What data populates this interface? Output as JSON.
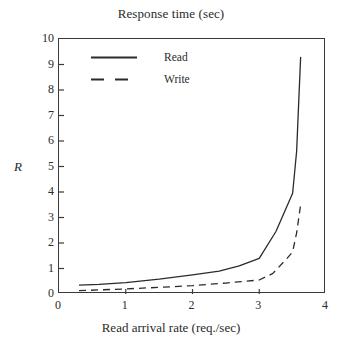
{
  "chart_data": {
    "type": "line",
    "title": "Response time (sec)",
    "xlabel": "Read arrival rate (req./sec)",
    "ylabel": "R",
    "xlim": [
      0,
      4
    ],
    "ylim": [
      0,
      10
    ],
    "xticks": [
      "0",
      "1",
      "2",
      "3",
      "4"
    ],
    "yticks": [
      "0",
      "1",
      "2",
      "3",
      "4",
      "5",
      "6",
      "7",
      "8",
      "9",
      "10"
    ],
    "grid": false,
    "legend_position": "upper-left-inside",
    "series": [
      {
        "name": "Read",
        "style": "solid",
        "color": "#2b2b2b",
        "x": [
          0.3,
          0.6,
          1.0,
          1.5,
          2.0,
          2.4,
          2.7,
          3.0,
          3.25,
          3.5,
          3.56,
          3.62
        ],
        "y": [
          0.35,
          0.38,
          0.45,
          0.58,
          0.75,
          0.9,
          1.1,
          1.4,
          2.45,
          3.95,
          5.6,
          9.3
        ]
      },
      {
        "name": "Write",
        "style": "dashed",
        "color": "#2b2b2b",
        "x": [
          0.3,
          0.6,
          1.0,
          1.5,
          2.0,
          2.5,
          3.0,
          3.2,
          3.4,
          3.5,
          3.56,
          3.62
        ],
        "y": [
          0.13,
          0.16,
          0.2,
          0.26,
          0.33,
          0.43,
          0.55,
          0.8,
          1.35,
          1.65,
          2.4,
          3.5
        ]
      }
    ]
  },
  "legend": {
    "items": [
      {
        "label": "Read",
        "style": "solid"
      },
      {
        "label": "Write",
        "style": "dashed"
      }
    ]
  }
}
